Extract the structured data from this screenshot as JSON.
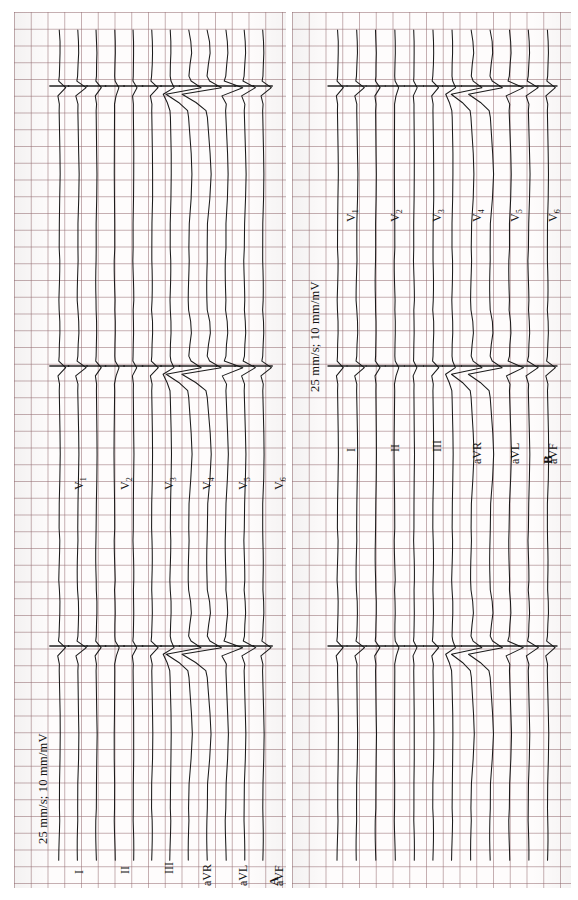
{
  "figure": {
    "paper_color": "#fefcfc",
    "grid_color": "#9a6e73",
    "trace_color": "#1b1b1b"
  },
  "panels": [
    {
      "id": "A",
      "label": "A",
      "calibration": "25 mm/s;  10 mm/mV",
      "leads_limb": [
        "I",
        "II",
        "III",
        "aVR",
        "aVL",
        "aVF"
      ],
      "leads_chest": [
        "V",
        "V",
        "V",
        "V",
        "V",
        "V"
      ],
      "chest_subscripts": [
        "1",
        "2",
        "3",
        "4",
        "5",
        "6"
      ],
      "beats_per_row": 3,
      "lead_rows": [
        {
          "name": "I",
          "sub": ""
        },
        {
          "name": "II",
          "sub": ""
        },
        {
          "name": "III",
          "sub": ""
        },
        {
          "name": "aVR",
          "sub": ""
        },
        {
          "name": "aVL",
          "sub": ""
        },
        {
          "name": "aVF",
          "sub": ""
        }
      ],
      "chest_rows": [
        {
          "name": "V",
          "sub": "1"
        },
        {
          "name": "V",
          "sub": "2"
        },
        {
          "name": "V",
          "sub": "3"
        },
        {
          "name": "V",
          "sub": "4"
        },
        {
          "name": "V",
          "sub": "5"
        },
        {
          "name": "V",
          "sub": "6"
        }
      ]
    },
    {
      "id": "B",
      "label": "B",
      "calibration": "25 mm/s;  10 mm/mV",
      "leads_limb": [
        "I",
        "II",
        "III",
        "aVR",
        "aVL",
        "aVF"
      ],
      "leads_chest": [
        "V",
        "V",
        "V",
        "V",
        "V",
        "V"
      ],
      "chest_subscripts": [
        "1",
        "2",
        "3",
        "4",
        "5",
        "6"
      ],
      "beats_per_row": 3,
      "lead_rows": [
        {
          "name": "I",
          "sub": ""
        },
        {
          "name": "II",
          "sub": ""
        },
        {
          "name": "III",
          "sub": ""
        },
        {
          "name": "aVR",
          "sub": ""
        },
        {
          "name": "aVL",
          "sub": ""
        },
        {
          "name": "aVF",
          "sub": ""
        }
      ],
      "chest_rows": [
        {
          "name": "V",
          "sub": "1"
        },
        {
          "name": "V",
          "sub": "2"
        },
        {
          "name": "V",
          "sub": "3"
        },
        {
          "name": "V",
          "sub": "4"
        },
        {
          "name": "V",
          "sub": "5"
        },
        {
          "name": "V",
          "sub": "6"
        }
      ]
    }
  ],
  "chart_data": {
    "type": "line",
    "xlabel": "time (25 mm/s)",
    "ylabel": "amplitude (10 mm/mV)",
    "paper_speed_mm_per_s": 25,
    "gain_mm_per_mV": 10,
    "grid": true,
    "legend": "none",
    "panels": [
      {
        "label": "A",
        "calibration": "25 mm/s;  10 mm/mV",
        "series": [
          {
            "name": "I",
            "beats": 3,
            "qrs_amplitude_mv": 0.45,
            "polarity": "positive"
          },
          {
            "name": "II",
            "beats": 3,
            "qrs_amplitude_mv": 0.6,
            "polarity": "positive"
          },
          {
            "name": "III",
            "beats": 3,
            "qrs_amplitude_mv": 0.35,
            "polarity": "positive"
          },
          {
            "name": "aVR",
            "beats": 3,
            "qrs_amplitude_mv": 0.3,
            "polarity": "negative"
          },
          {
            "name": "aVL",
            "beats": 3,
            "qrs_amplitude_mv": 0.25,
            "polarity": "positive"
          },
          {
            "name": "aVF",
            "beats": 3,
            "qrs_amplitude_mv": 0.45,
            "polarity": "positive"
          },
          {
            "name": "V1",
            "beats": 3,
            "qrs_amplitude_mv": 0.5,
            "polarity": "biphasic"
          },
          {
            "name": "V2",
            "beats": 3,
            "qrs_amplitude_mv": 1.6,
            "polarity": "biphasic"
          },
          {
            "name": "V3",
            "beats": 3,
            "qrs_amplitude_mv": 1.8,
            "polarity": "biphasic"
          },
          {
            "name": "V4",
            "beats": 3,
            "qrs_amplitude_mv": 1.2,
            "polarity": "positive"
          },
          {
            "name": "V5",
            "beats": 3,
            "qrs_amplitude_mv": 0.8,
            "polarity": "positive"
          },
          {
            "name": "V6",
            "beats": 3,
            "qrs_amplitude_mv": 0.6,
            "polarity": "positive"
          }
        ]
      },
      {
        "label": "B",
        "calibration": "25 mm/s;  10 mm/mV",
        "series": [
          {
            "name": "I",
            "beats": 3,
            "qrs_amplitude_mv": 0.4,
            "polarity": "positive"
          },
          {
            "name": "II",
            "beats": 3,
            "qrs_amplitude_mv": 0.55,
            "polarity": "positive"
          },
          {
            "name": "III",
            "beats": 3,
            "qrs_amplitude_mv": 0.3,
            "polarity": "positive"
          },
          {
            "name": "aVR",
            "beats": 3,
            "qrs_amplitude_mv": 0.28,
            "polarity": "negative"
          },
          {
            "name": "aVL",
            "beats": 3,
            "qrs_amplitude_mv": 0.22,
            "polarity": "positive"
          },
          {
            "name": "aVF",
            "beats": 3,
            "qrs_amplitude_mv": 0.4,
            "polarity": "positive"
          },
          {
            "name": "V1",
            "beats": 3,
            "qrs_amplitude_mv": 0.45,
            "polarity": "biphasic"
          },
          {
            "name": "V2",
            "beats": 3,
            "qrs_amplitude_mv": 1.4,
            "polarity": "biphasic"
          },
          {
            "name": "V3",
            "beats": 3,
            "qrs_amplitude_mv": 1.55,
            "polarity": "biphasic"
          },
          {
            "name": "V4",
            "beats": 3,
            "qrs_amplitude_mv": 1.0,
            "polarity": "positive"
          },
          {
            "name": "V5",
            "beats": 3,
            "qrs_amplitude_mv": 0.7,
            "polarity": "positive"
          },
          {
            "name": "V6",
            "beats": 3,
            "qrs_amplitude_mv": 0.55,
            "polarity": "positive"
          }
        ]
      }
    ]
  }
}
